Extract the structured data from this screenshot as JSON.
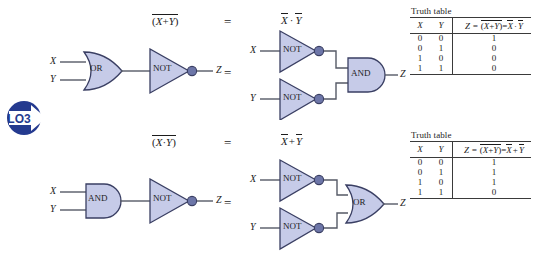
{
  "figure": {
    "badge": {
      "label": "LO3",
      "color": "#243a8f"
    },
    "colors": {
      "gate_fill": "#c6cbe8",
      "gate_stroke": "#3a3f63",
      "wire": "#555a66",
      "text": "#1c1c1c",
      "rule": "#3a3a3a"
    }
  },
  "rows": [
    {
      "id": "nor-row",
      "left_expression": {
        "paren_open": "(",
        "a": "X",
        "op": "+",
        "b": "Y",
        "paren_close": ")",
        "overline": true
      },
      "equals": "=",
      "right_expression": {
        "a": "X",
        "op": "·",
        "b": "Y",
        "a_overline": true,
        "b_overline": true
      },
      "left_circuit": {
        "input_a": "X",
        "input_b": "Y",
        "gate1": "OR",
        "gate2": "NOT",
        "output": "Z"
      },
      "middle_equals": "=",
      "right_circuit": {
        "input_a": "X",
        "input_b": "Y",
        "inverter_a": "NOT",
        "inverter_b": "NOT",
        "gate": "AND",
        "output": "Z"
      },
      "truth_table": {
        "caption": "Truth table",
        "headers": {
          "x": "X",
          "y": "Y",
          "z_prefix": "Z = ",
          "z_lhs_open": "(",
          "z_lhs_a": "X",
          "z_lhs_op": "+",
          "z_lhs_b": "Y",
          "z_lhs_close": ")",
          "z_eq": "=",
          "z_rhs_a": "X",
          "z_rhs_op": "·",
          "z_rhs_b": "Y"
        },
        "rows": [
          {
            "x": "0",
            "y": "0",
            "z": "1"
          },
          {
            "x": "0",
            "y": "1",
            "z": "0"
          },
          {
            "x": "1",
            "y": "0",
            "z": "0"
          },
          {
            "x": "1",
            "y": "1",
            "z": "0"
          }
        ]
      }
    },
    {
      "id": "nand-row",
      "left_expression": {
        "paren_open": "(",
        "a": "X",
        "op": "·",
        "b": "Y",
        "paren_close": ")",
        "overline": true
      },
      "equals": "=",
      "right_expression": {
        "a": "X",
        "op": "+",
        "b": "Y",
        "a_overline": true,
        "b_overline": true
      },
      "left_circuit": {
        "input_a": "X",
        "input_b": "Y",
        "gate1": "AND",
        "gate2": "NOT",
        "output": "Z"
      },
      "middle_equals": "=",
      "right_circuit": {
        "input_a": "X",
        "input_b": "Y",
        "inverter_a": "NOT",
        "inverter_b": "NOT",
        "gate": "OR",
        "output": "Z"
      },
      "truth_table": {
        "caption": "Truth table",
        "headers": {
          "x": "X",
          "y": "Y",
          "z_prefix": "Z = ",
          "z_lhs_open": "(",
          "z_lhs_a": "X",
          "z_lhs_op": "+",
          "z_lhs_b": "Y",
          "z_lhs_close": ")",
          "z_eq": "=",
          "z_rhs_a": "X",
          "z_rhs_op": "+",
          "z_rhs_b": "Y"
        },
        "rows": [
          {
            "x": "0",
            "y": "0",
            "z": "1"
          },
          {
            "x": "0",
            "y": "1",
            "z": "1"
          },
          {
            "x": "1",
            "y": "0",
            "z": "1"
          },
          {
            "x": "1",
            "y": "1",
            "z": "0"
          }
        ]
      }
    }
  ]
}
